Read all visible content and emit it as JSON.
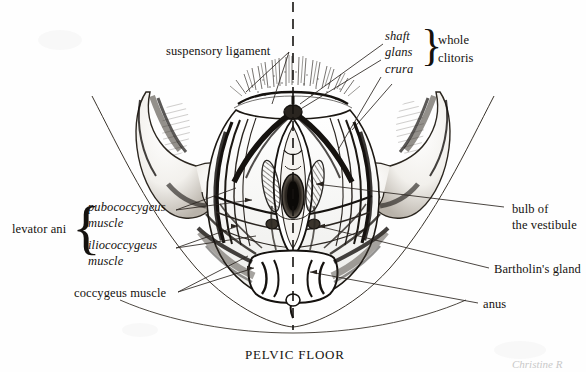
{
  "figure": {
    "title_caption": "PELVIC FLOOR",
    "signature": "Christine R",
    "midline_style": "dashed-vertical"
  },
  "labels": {
    "suspensory_ligament": "suspensory ligament",
    "shaft": "shaft",
    "glans": "glans",
    "crura": "crura",
    "whole": "whole",
    "clitoris": "clitoris",
    "levator_ani": "levator ani",
    "pubococcygeus": "pubococcygeus",
    "pubococcygeus_muscle": "muscle",
    "iliococcygeus": "iliococcygeus",
    "iliococcygeus_muscle": "muscle",
    "coccygeus_muscle": "coccygeus muscle",
    "bulb_of": "bulb of",
    "the_vestibule": "the vestibule",
    "bartholins_gland": "Bartholin's gland",
    "anus": "anus"
  },
  "colors": {
    "ink": "#15120f",
    "paper": "#fefefe",
    "leader": "#2a2520",
    "signature": "#c9c9c9"
  }
}
